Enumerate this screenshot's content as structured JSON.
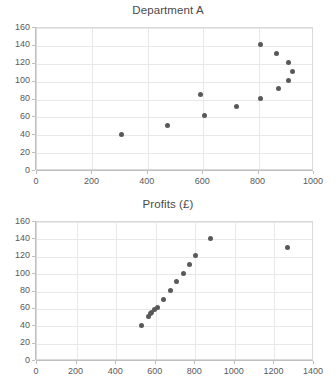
{
  "page": {
    "background_color": "#ffffff",
    "marker_color": "#595959",
    "grid_color": "#e8e8e8",
    "frame_color": "#d9d9d9",
    "axis_color": "#bfbfbf"
  },
  "chart_data": [
    {
      "id": "department-a",
      "type": "scatter",
      "title": "Department A",
      "xlabel": "",
      "ylabel": "",
      "xlim": [
        0,
        1000
      ],
      "ylim": [
        0,
        160
      ],
      "xticks": [
        0,
        200,
        400,
        600,
        800,
        1000
      ],
      "yticks": [
        0,
        20,
        40,
        60,
        80,
        100,
        120,
        140,
        160
      ],
      "xtick_labels": [
        "0",
        "200",
        "400",
        "600",
        "800",
        "1000"
      ],
      "ytick_labels": [
        "0",
        "20",
        "40",
        "60",
        "80",
        "100",
        "120",
        "140",
        "160"
      ],
      "grid": true,
      "legend": false,
      "points": [
        {
          "x": 310,
          "y": 40
        },
        {
          "x": 475,
          "y": 50
        },
        {
          "x": 595,
          "y": 85
        },
        {
          "x": 608,
          "y": 61
        },
        {
          "x": 725,
          "y": 71
        },
        {
          "x": 810,
          "y": 140
        },
        {
          "x": 812,
          "y": 80
        },
        {
          "x": 870,
          "y": 130
        },
        {
          "x": 875,
          "y": 91
        },
        {
          "x": 910,
          "y": 120
        },
        {
          "x": 912,
          "y": 100
        },
        {
          "x": 925,
          "y": 110
        }
      ]
    },
    {
      "id": "profits",
      "type": "scatter",
      "title": "Profits (£)",
      "xlabel": "",
      "ylabel": "",
      "xlim": [
        0,
        1400
      ],
      "ylim": [
        0,
        160
      ],
      "xticks": [
        0,
        200,
        400,
        600,
        800,
        1000,
        1200,
        1400
      ],
      "yticks": [
        0,
        20,
        40,
        60,
        80,
        100,
        120,
        140,
        160
      ],
      "xtick_labels": [
        "0",
        "200",
        "400",
        "600",
        "800",
        "1000",
        "1200",
        "1400"
      ],
      "ytick_labels": [
        "0",
        "20",
        "40",
        "60",
        "80",
        "100",
        "120",
        "140",
        "160"
      ],
      "grid": true,
      "legend": false,
      "points": [
        {
          "x": 535,
          "y": 40
        },
        {
          "x": 570,
          "y": 50
        },
        {
          "x": 578,
          "y": 53
        },
        {
          "x": 585,
          "y": 55
        },
        {
          "x": 600,
          "y": 58
        },
        {
          "x": 612,
          "y": 60
        },
        {
          "x": 645,
          "y": 70
        },
        {
          "x": 680,
          "y": 80
        },
        {
          "x": 710,
          "y": 90
        },
        {
          "x": 745,
          "y": 100
        },
        {
          "x": 775,
          "y": 110
        },
        {
          "x": 805,
          "y": 120
        },
        {
          "x": 880,
          "y": 140
        },
        {
          "x": 1270,
          "y": 130
        }
      ]
    }
  ]
}
